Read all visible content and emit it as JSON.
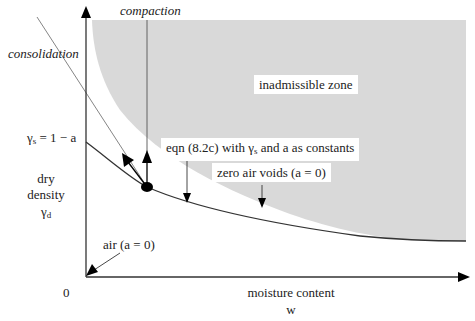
{
  "diagram": {
    "axes": {
      "x_label": "moisture content",
      "x_symbol": "w",
      "y_label_line1": "dry",
      "y_label_line2": "density",
      "y_symbol": "γ",
      "y_symbol_sub": "d",
      "origin": "0",
      "y_intercept_label_prefix": "γ",
      "y_intercept_label_sub": "s",
      "y_intercept_label_suffix": " = 1 − a"
    },
    "labels": {
      "compaction": "compaction",
      "consolidation": "consolidation",
      "inadmissible_zone": "inadmissible zone",
      "eqn_prefix": "eqn (8.2c) with γ",
      "eqn_sub": "s",
      "eqn_suffix": " and a as constants",
      "zero_air_voids": "zero air voids (a = 0)",
      "air": "air (a = 0)"
    },
    "colors": {
      "inadmissible_fill": "#d9d9d9",
      "line": "#333333",
      "arrow": "#000000"
    }
  }
}
